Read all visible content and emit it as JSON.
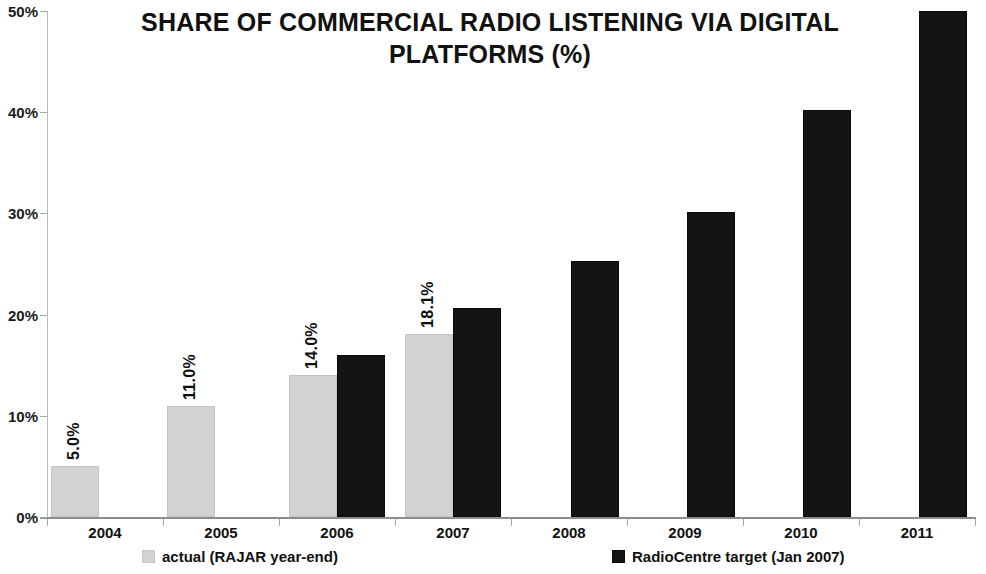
{
  "chart_data": {
    "type": "bar",
    "title": "SHARE OF COMMERCIAL RADIO LISTENING VIA DIGITAL\nPLATFORMS (%)",
    "xlabel": "",
    "ylabel": "",
    "ylim": [
      0,
      50
    ],
    "ytick_labels": [
      "0%",
      "10%",
      "20%",
      "30%",
      "40%",
      "50%"
    ],
    "ytick_values": [
      0,
      10,
      20,
      30,
      40,
      50
    ],
    "grid": false,
    "legend_position": "bottom",
    "categories": [
      "2004",
      "2005",
      "2006",
      "2007",
      "2008",
      "2009",
      "2010",
      "2011"
    ],
    "series": [
      {
        "name": "actual (RAJAR year-end)",
        "color": "#d2d2d2",
        "values": [
          5.0,
          11.0,
          14.0,
          18.1,
          null,
          null,
          null,
          null
        ],
        "data_labels": [
          "5.0%",
          "11.0%",
          "14.0%",
          "18.1%",
          "",
          "",
          "",
          ""
        ],
        "data_labels_rotated": true
      },
      {
        "name": "RadioCentre target (Jan 2007)",
        "color": "#141414",
        "values": [
          null,
          null,
          16.0,
          20.7,
          25.3,
          30.1,
          40.2,
          50.0
        ],
        "data_labels": [
          "",
          "",
          "",
          "",
          "",
          "",
          "",
          ""
        ],
        "data_labels_rotated": false
      }
    ]
  },
  "axis": {
    "ticks": [
      {
        "label": "50%",
        "value": 50
      },
      {
        "label": "40%",
        "value": 40
      },
      {
        "label": "30%",
        "value": 30
      },
      {
        "label": "20%",
        "value": 20
      },
      {
        "label": "10%",
        "value": 10
      },
      {
        "label": "0%",
        "value": 0
      }
    ]
  },
  "legend": {
    "actual": "actual (RAJAR year-end)",
    "target": "RadioCentre target (Jan 2007)"
  }
}
